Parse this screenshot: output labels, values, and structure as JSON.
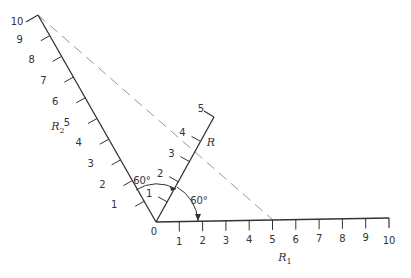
{
  "diagram": {
    "type": "nomograph",
    "origin_label": "0",
    "axes": [
      {
        "name": "R1",
        "label": "R",
        "subscript": "1",
        "ticks": [
          "1",
          "2",
          "3",
          "4",
          "5",
          "6",
          "7",
          "8",
          "9",
          "10"
        ],
        "angle_deg": 0
      },
      {
        "name": "R",
        "label": "R",
        "subscript": "",
        "ticks": [
          "1",
          "2",
          "3",
          "4",
          "5"
        ],
        "angle_deg": 60
      },
      {
        "name": "R2",
        "label": "R",
        "subscript": "2",
        "ticks": [
          "1",
          "2",
          "3",
          "4",
          "5",
          "6",
          "7",
          "8",
          "9",
          "10"
        ],
        "angle_deg": 120
      }
    ],
    "angles": [
      {
        "label": "60°",
        "between": "R2-R"
      },
      {
        "label": "60°",
        "between": "R-R1"
      }
    ],
    "dashed_line": {
      "from": "R2=10",
      "to": "R1=5",
      "passes": "R≈3.3"
    },
    "colors": {
      "line": "#333333",
      "dashed": "#999999",
      "text": "#333333"
    }
  }
}
